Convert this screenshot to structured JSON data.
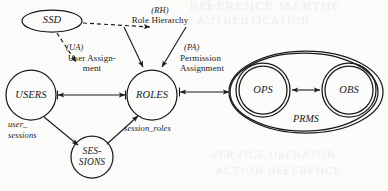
{
  "diagram": {
    "ink_color": "#1a1a1a",
    "paper_color": "#fbfbfa",
    "nodes": {
      "ssd": {
        "label": "SSD",
        "shape": "ellipse",
        "cx": 52,
        "cy": 21,
        "rx": 30,
        "ry": 11
      },
      "users": {
        "label": "USERS",
        "shape": "circle",
        "cx": 31,
        "cy": 95,
        "r": 25
      },
      "roles": {
        "label": "ROLES",
        "shape": "circle",
        "cx": 152,
        "cy": 95,
        "r": 25
      },
      "sessions": {
        "label_line1": "SES-",
        "label_line2": "SIONS",
        "shape": "circle",
        "cx": 92,
        "cy": 157,
        "r": 21
      },
      "ops": {
        "label": "OPS",
        "shape": "circle",
        "cx": 263,
        "cy": 90,
        "r": 25
      },
      "obs": {
        "label": "OBS",
        "shape": "circle",
        "cx": 349,
        "cy": 90,
        "r": 25
      },
      "prms": {
        "label": "PRMS",
        "shape": "ellipse",
        "cx": 306,
        "cy": 92,
        "rx": 77,
        "ry": 41
      }
    },
    "edges": {
      "role_hierarchy": {
        "code": "(RH)",
        "text": "Role Hierarchy"
      },
      "user_assignment": {
        "code": "(UA)",
        "text_line1": "User Assign-",
        "text_line2": "ment"
      },
      "permission_assignment": {
        "code": "(PA)",
        "text_line1": "Permission",
        "text_line2": "Assignment"
      },
      "user_sessions": {
        "text_line1": "user_",
        "text_line2": "sessions"
      },
      "session_roles": {
        "text": "session_roles"
      }
    }
  }
}
